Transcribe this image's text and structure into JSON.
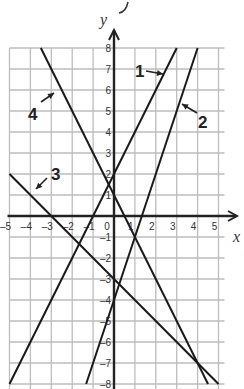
{
  "chart_data": {
    "type": "line",
    "title": "",
    "xlabel": "x",
    "ylabel": "y",
    "xlim": [
      -5,
      5
    ],
    "ylim": [
      -8,
      8
    ],
    "grid": true,
    "x_ticks": [
      "-5",
      "-4",
      "-3",
      "-2",
      "-1",
      "0",
      "1",
      "2",
      "3",
      "4",
      "5"
    ],
    "y_ticks": [
      "8",
      "7",
      "6",
      "5",
      "4",
      "3",
      "2",
      "1",
      "-1",
      "-2",
      "-3",
      "-4",
      "-5",
      "-6",
      "-7",
      "-8"
    ],
    "series": [
      {
        "name": "1",
        "equation": "y = 2x + 2",
        "slope": 2,
        "intercept": 2
      },
      {
        "name": "2",
        "equation": "y = 3x - 4",
        "slope": 3,
        "intercept": -4
      },
      {
        "name": "3",
        "equation": "y = -x - 3",
        "slope": -1,
        "intercept": -3
      },
      {
        "name": "4",
        "equation": "y = -2x + 1",
        "slope": -2,
        "intercept": 1
      }
    ],
    "annotations": [
      {
        "text": "1",
        "arrow_to_line": "1"
      },
      {
        "text": "2",
        "arrow_to_line": "2"
      },
      {
        "text": "3",
        "arrow_to_line": "3"
      },
      {
        "text": "4",
        "arrow_to_line": "4"
      }
    ]
  },
  "labels": {
    "x_axis": "x",
    "y_axis": "y",
    "line1": "1",
    "line2": "2",
    "line3": "3",
    "line4": "4"
  }
}
